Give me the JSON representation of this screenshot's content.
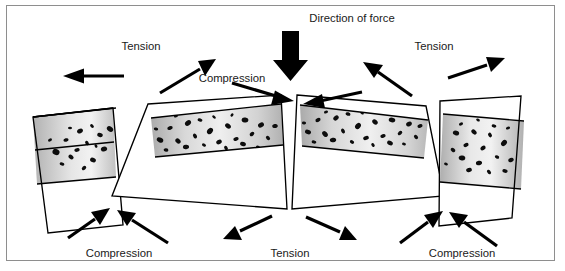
{
  "figure": {
    "title_caption": "",
    "background_color": "#ffffff",
    "frame_color": "#8e8e8e",
    "type": "geology-diagram"
  },
  "labels": {
    "direction_of_force": "Direction of force",
    "tension_top_left": "Tension",
    "tension_top_right": "Tension",
    "compression_top_center": "Compression",
    "compression_bottom_left": "Compression",
    "tension_bottom_center": "Tension",
    "compression_bottom_right": "Compression"
  },
  "icons": {
    "main_force_arrow": "thick-down-arrow-icon",
    "tension_arrow": "tension-arrow-icon",
    "compression_arrow": "compression-arrow-icon"
  },
  "colors": {
    "rock_band_gray": "#9e9e9e",
    "rock_band_light": "#f0f0f0",
    "speckle": "#0d0d0d",
    "outline": "#000000",
    "text": "#1a1a1a",
    "arrow": "#000000"
  },
  "blocks": [
    {
      "name": "block-far-left",
      "tilt": "tilted-right",
      "bands": [
        "white",
        "speckled-gray",
        "white"
      ]
    },
    {
      "name": "block-center-left",
      "tilt": "tilted-up-right",
      "bands": [
        "white",
        "speckled-gray",
        "white"
      ]
    },
    {
      "name": "block-center-right",
      "tilt": "tilted-up-left",
      "bands": [
        "white",
        "speckled-gray",
        "white"
      ]
    },
    {
      "name": "block-far-right",
      "tilt": "tilted-left",
      "bands": [
        "white",
        "speckled-gray",
        "white"
      ]
    }
  ]
}
